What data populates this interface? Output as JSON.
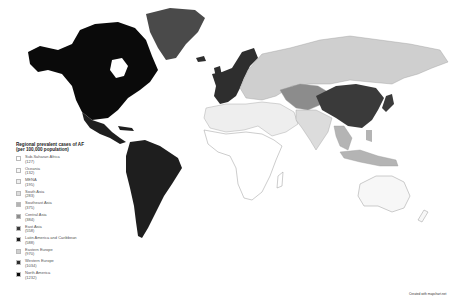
{
  "legend": {
    "title_line1": "Regional prevalent cases of AF",
    "title_line2": "(per 100,000 population)",
    "items": [
      {
        "region": "Sub-Saharan Africa",
        "value": "(127)",
        "color": "#ffffff"
      },
      {
        "region": "Oceania",
        "value": "(132)",
        "color": "#f7f7f7"
      },
      {
        "region": "MENA",
        "value": "(195)",
        "color": "#eeeeee"
      },
      {
        "region": "South Asia",
        "value": "(283)",
        "color": "#dcdcdc"
      },
      {
        "region": "Southeast Asia",
        "value": "(375)",
        "color": "#b4b4b4"
      },
      {
        "region": "Central Asia",
        "value": "(384)",
        "color": "#8c8c8c"
      },
      {
        "region": "East Asia",
        "value": "(558)",
        "color": "#3a3a3a"
      },
      {
        "region": "Latin America and Caribbean",
        "value": "(588)",
        "color": "#1e1e1e"
      },
      {
        "region": "Eastern Europe",
        "value": "(970)",
        "color": "#cfcfcf"
      },
      {
        "region": "Western Europe",
        "value": "(1034)",
        "color": "#2e2e2e"
      },
      {
        "region": "North America",
        "value": "(1232)",
        "color": "#0a0a0a"
      }
    ]
  },
  "credit": "Created with mapchart.net",
  "colors": {
    "north_america": "#0a0a0a",
    "greenland": "#4a4a4a",
    "latin_america": "#1e1e1e",
    "western_europe": "#2e2e2e",
    "eastern_europe": "#cfcfcf",
    "central_asia": "#8c8c8c",
    "east_asia": "#3a3a3a",
    "south_asia": "#dcdcdc",
    "southeast_asia": "#b4b4b4",
    "mena": "#eeeeee",
    "sub_saharan_africa": "#ffffff",
    "oceania": "#f7f7f7",
    "border": "#9a9a9a"
  }
}
